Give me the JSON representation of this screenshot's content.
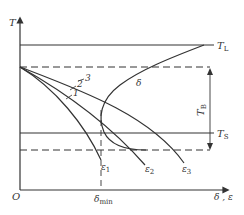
{
  "diagram": {
    "axes": {
      "y_label": "T",
      "x_label": "δ , ε",
      "origin_label": "O"
    },
    "levels": {
      "upper_solid": "T",
      "upper_solid_sub": "L",
      "lower_solid": "T",
      "lower_solid_sub": "S",
      "range": "T",
      "range_sub": "B"
    },
    "curves": {
      "delta": "δ",
      "line_labels": [
        "1",
        "2",
        "3"
      ],
      "end_labels": [
        {
          "sym": "ε",
          "sub": "1"
        },
        {
          "sym": "ε",
          "sub": "2"
        },
        {
          "sym": "ε",
          "sub": "3"
        }
      ]
    },
    "markers": {
      "delta_min": "δ",
      "delta_min_sub": "min"
    },
    "colors": {
      "line": "#333333",
      "background": "#ffffff"
    }
  }
}
